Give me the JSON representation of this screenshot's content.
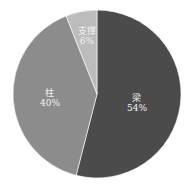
{
  "chart_data": {
    "type": "pie",
    "title": "",
    "categories": [
      "梁",
      "柱",
      "支撑"
    ],
    "values": [
      54,
      40,
      6
    ],
    "labels": [
      {
        "name": "梁",
        "pct": "54%"
      },
      {
        "name": "柱",
        "pct": "40%"
      },
      {
        "name": "支撑",
        "pct": "6%"
      }
    ],
    "colors": [
      "#4b4b4b",
      "#8c8c8c",
      "#bcbcbc"
    ],
    "start_angle_deg": 0,
    "direction": "clockwise",
    "legend": "none"
  }
}
